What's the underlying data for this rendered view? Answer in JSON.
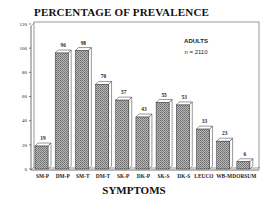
{
  "chart_data": {
    "type": "bar",
    "title": "PERCENTAGE OF PREVALENCE",
    "xlabel": "SYMPTOMS",
    "ylabel": "",
    "ylim": [
      0,
      120
    ],
    "yticks": [
      0,
      20,
      40,
      60,
      80,
      100,
      120
    ],
    "categories": [
      "SM-P",
      "DM-P",
      "SM-T",
      "DM-T",
      "SK-P",
      "DK-P",
      "SK-S",
      "DK-S",
      "LEUCO",
      "WB-M",
      "DORSUM"
    ],
    "values": [
      19,
      96,
      98,
      70,
      57,
      43,
      55,
      53,
      33,
      23,
      6
    ],
    "annotation": {
      "group": "ADULTS",
      "n": "n = 2110"
    },
    "style": {
      "bars": "3D hatched grey",
      "grid": false,
      "legend": "none"
    }
  },
  "colors": {
    "bar_fill": "#9a9a9a",
    "bar_top": "#ffffff",
    "frame": "#333333"
  }
}
